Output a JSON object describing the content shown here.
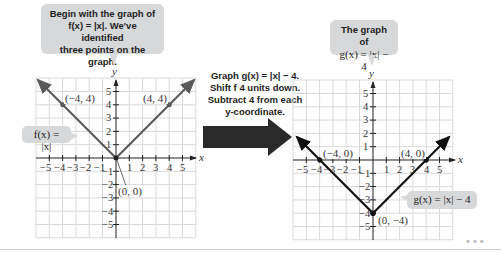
{
  "left_callout": {
    "line1": "Begin with the graph of",
    "line2": "f(x) = |x|. We've identified",
    "line3": "three points on the graph."
  },
  "middle_text": {
    "line1": "Graph g(x) = |x| − 4.",
    "line2": "Shift f 4 units down.",
    "line3": "Subtract 4 from each",
    "line4": "y-coordinate."
  },
  "right_callout": {
    "line1": "The graph of",
    "line2": "g(x) = |x| − 4"
  },
  "left_graph": {
    "function_label": "f(x) = |x|",
    "points": [
      {
        "label": "(−4, 4)",
        "x": -4,
        "y": 4
      },
      {
        "label": "(4, 4)",
        "x": 4,
        "y": 4
      },
      {
        "label": "(0, 0)",
        "x": 0,
        "y": 0
      }
    ],
    "x_axis_label": "x",
    "y_axis_label": "y"
  },
  "right_graph": {
    "function_label": "g(x) = |x| − 4",
    "points": [
      {
        "label": "(−4, 0)",
        "x": -4,
        "y": 0
      },
      {
        "label": "(4, 0)",
        "x": 4,
        "y": 0
      },
      {
        "label": "(0, −4)",
        "x": 0,
        "y": -4
      }
    ],
    "x_axis_label": "x",
    "y_axis_label": "y"
  },
  "tick_labels": {
    "x": [
      "−5",
      "−4",
      "−3",
      "−2",
      "−1",
      "1",
      "2",
      "3",
      "4",
      "5"
    ],
    "y": [
      "5",
      "4",
      "3",
      "2",
      "1",
      "−1",
      "−2",
      "−3",
      "−4",
      "−5"
    ]
  },
  "more_dots": "•••",
  "colors": {
    "f_line": "#5a5a5a",
    "g_line": "#111111",
    "callout_bg": "#d6d8d9",
    "grid": "#d9d9d9",
    "arrow": "#2a2a2a"
  }
}
